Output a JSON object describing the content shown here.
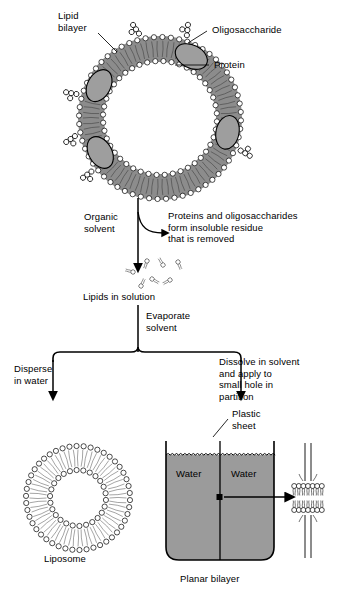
{
  "figure": {
    "colors": {
      "ink": "#000000",
      "lipid_tail_gray": "#8c8c8c",
      "protein_gray": "#9e9e9e",
      "water_gray": "#9b9b9b",
      "head_fill": "#ffffff"
    }
  },
  "top_diagram": {
    "labels": {
      "lipid_bilayer": "Lipid\nbilayer",
      "oligosaccharide": "Oligosaccharide",
      "protein": "Protein"
    }
  },
  "flow": {
    "step1_label": "Organic\nsolvent",
    "step1_side_text": "Proteins and oligosaccharides\nform insoluble residue\nthat is removed",
    "lipids_caption": "Lipids in solution",
    "step2_label": "Evaporate\nsolvent",
    "branch_left_label": "Disperse\nin water",
    "branch_right_label": "Dissolve in solvent\nand apply to\nsmall hole in\npartition"
  },
  "bottom_left": {
    "caption": "Liposome"
  },
  "bottom_right": {
    "plastic_sheet_label": "Plastic\nsheet",
    "water_left": "Water",
    "water_right": "Water",
    "caption": "Planar bilayer"
  }
}
